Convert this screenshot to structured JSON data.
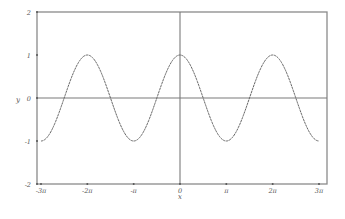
{
  "chart_data": {
    "type": "line",
    "title": "",
    "xlabel": "x",
    "ylabel": "y",
    "function": "cos(x)",
    "xlim": [
      -9.4248,
      9.4248
    ],
    "ylim": [
      -2,
      2
    ],
    "grid": false,
    "legend": null,
    "x_ticks": [
      {
        "value": -9.4248,
        "label": "-3π"
      },
      {
        "value": -6.2832,
        "label": "-2π"
      },
      {
        "value": -3.1416,
        "label": "-π"
      },
      {
        "value": 0,
        "label": "0"
      },
      {
        "value": 3.1416,
        "label": "π"
      },
      {
        "value": 6.2832,
        "label": "2π"
      },
      {
        "value": 9.4248,
        "label": "3π"
      }
    ],
    "y_ticks": [
      {
        "value": 2,
        "label": "2"
      },
      {
        "value": 1,
        "label": "1"
      },
      {
        "value": 0,
        "label": "0"
      },
      {
        "value": -1,
        "label": "-1"
      },
      {
        "value": -2,
        "label": "-2"
      }
    ],
    "series": [
      {
        "name": "cos(x)",
        "color": "#666666",
        "x": [
          -9.4248,
          -7.854,
          -6.2832,
          -4.7124,
          -3.1416,
          -1.5708,
          0,
          1.5708,
          3.1416,
          4.7124,
          6.2832,
          7.854,
          9.4248
        ],
        "values": [
          -1,
          0,
          1,
          0,
          -1,
          0,
          1,
          0,
          -1,
          0,
          1,
          0,
          -1
        ]
      }
    ]
  },
  "colors": {
    "frame": "#8a8a8a",
    "axis": "#7a7a7a",
    "curve": "#6a6a6a",
    "text": "#555555"
  }
}
